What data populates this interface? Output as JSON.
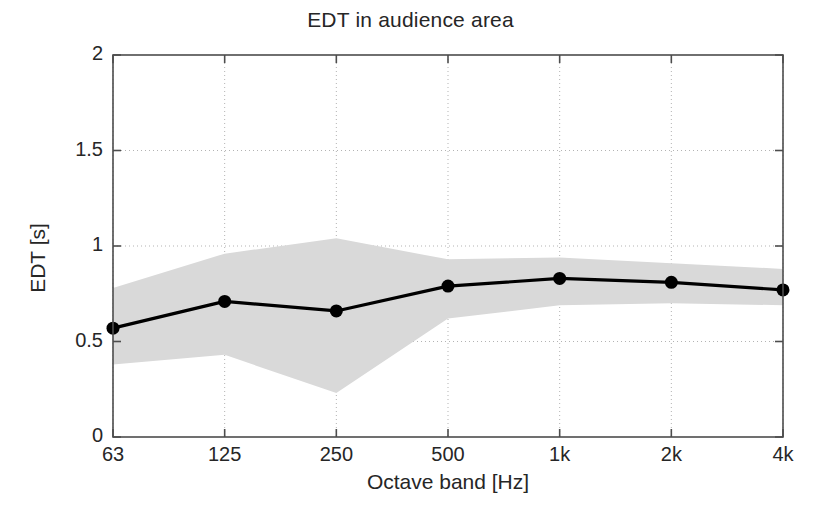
{
  "chart_data": {
    "type": "line",
    "title": "EDT in audience area",
    "xlabel": "Octave band [Hz]",
    "ylabel": "EDT [s]",
    "categories": [
      "63",
      "125",
      "250",
      "500",
      "1k",
      "2k",
      "4k"
    ],
    "xtick_labels": [
      "63",
      "125",
      "250",
      "500",
      "1k",
      "2k",
      "4k"
    ],
    "ytick_labels": [
      "0",
      "0.5",
      "1",
      "1.5",
      "2"
    ],
    "ytick_values": [
      0,
      0.5,
      1,
      1.5,
      2
    ],
    "ylim": [
      0,
      2
    ],
    "grid": true,
    "legend": null,
    "series": [
      {
        "name": "EDT mean",
        "values": [
          0.57,
          0.71,
          0.66,
          0.79,
          0.83,
          0.81,
          0.77
        ],
        "marker": "filled-circle",
        "color": "#000000"
      }
    ],
    "band": {
      "name": "EDT spread (shaded area)",
      "upper": [
        0.78,
        0.96,
        1.04,
        0.93,
        0.94,
        0.91,
        0.88
      ],
      "lower": [
        0.38,
        0.43,
        0.23,
        0.62,
        0.69,
        0.7,
        0.69
      ],
      "color": "#d9d9d9"
    }
  },
  "colors": {
    "line": "#000000",
    "band": "#d9d9d9",
    "axis": "#4d4d4d",
    "grid": "#b3b3b3",
    "background": "#ffffff",
    "text": "#262626"
  }
}
